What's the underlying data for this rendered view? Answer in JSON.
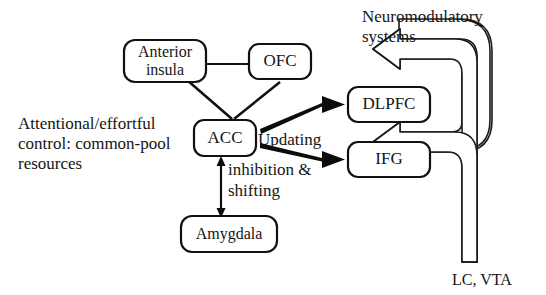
{
  "figure": {
    "type": "block-diagram",
    "background_color": "#ffffff",
    "ink_color": "#151515"
  },
  "nodes": {
    "anterior_insula": {
      "label_line1": "Anterior",
      "label_line2": "insula"
    },
    "ofc": {
      "label": "OFC"
    },
    "acc": {
      "label": "ACC"
    },
    "amygdala": {
      "label": "Amygdala"
    },
    "dlpfc": {
      "label": "DLPFC"
    },
    "ifg": {
      "label": "IFG"
    }
  },
  "labels": {
    "left_caption_line1": "Attentional/effortful",
    "left_caption_line2": "control: common-pool",
    "left_caption_line3": "resources",
    "updating": "Updating",
    "inhibition_line1": "inhibition &",
    "inhibition_line2": "shifting",
    "neuromodulatory_line1": "Neuromodulatory",
    "neuromodulatory_line2": "systems",
    "lc_vta": "LC, VTA"
  },
  "edges": [
    {
      "name": "insula-ofc",
      "from": "anterior_insula",
      "to": "ofc",
      "style": "thin-line",
      "arrowheads": "none"
    },
    {
      "name": "insula-acc",
      "from": "anterior_insula",
      "to": "acc",
      "style": "thin-line",
      "arrowheads": "none"
    },
    {
      "name": "ofc-acc",
      "from": "ofc",
      "to": "acc",
      "style": "thin-line",
      "arrowheads": "none"
    },
    {
      "name": "acc-amygdala",
      "from": "acc",
      "to": "amygdala",
      "style": "thin-line",
      "arrowheads": "both"
    },
    {
      "name": "acc-dlpfc",
      "from": "acc",
      "to": "dlpfc",
      "style": "thick-solid",
      "arrowheads": "end",
      "edge_label": "Updating"
    },
    {
      "name": "acc-ifg",
      "from": "acc",
      "to": "ifg",
      "style": "thick-solid",
      "arrowheads": "end",
      "edge_label": "inhibition & shifting"
    },
    {
      "name": "lcvta-dlpfc",
      "from": "lc_vta",
      "to": "dlpfc",
      "style": "hollow-block-arrow",
      "arrowheads": "end"
    },
    {
      "name": "lcvta-neuromodulatory",
      "from": "lc_vta",
      "to": "neuromodulatory_systems",
      "style": "hollow-block-arrow",
      "arrowheads": "end"
    }
  ]
}
